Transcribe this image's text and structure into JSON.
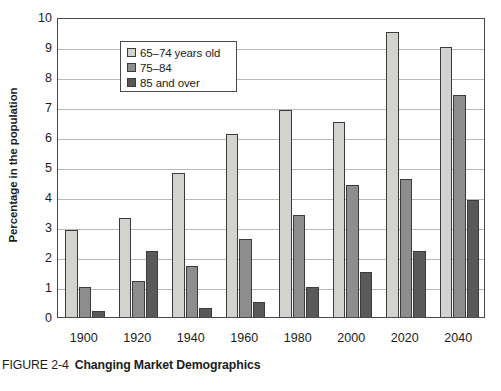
{
  "figure": {
    "caption_label": "FIGURE 2-4",
    "caption_title": "Changing Market Demographics"
  },
  "chart_data": {
    "type": "bar",
    "title": "Changing Market Demographics",
    "xlabel": "",
    "ylabel": "Percentage in the population",
    "ylim": [
      0,
      10
    ],
    "ytick_labels": [
      "10",
      "9",
      "8",
      "7",
      "6",
      "5",
      "4",
      "3",
      "2",
      "1",
      "0"
    ],
    "yticks": [
      10,
      9,
      8,
      7,
      6,
      5,
      4,
      3,
      2,
      1,
      0
    ],
    "grid": true,
    "legend_position": "upper-left-inside",
    "categories": [
      "1900",
      "1920",
      "1940",
      "1960",
      "1980",
      "2000",
      "2020",
      "2040"
    ],
    "series": [
      {
        "name": "65–74 years old",
        "color": "#d2d2cf",
        "values": [
          2.9,
          3.3,
          4.8,
          6.1,
          6.9,
          6.5,
          9.5,
          9.0
        ]
      },
      {
        "name": "75–84",
        "color": "#8d8d8d",
        "values": [
          1.0,
          1.2,
          1.7,
          2.6,
          3.4,
          4.4,
          4.6,
          7.4
        ]
      },
      {
        "name": "85 and over",
        "color": "#595959",
        "values": [
          0.2,
          2.2,
          0.3,
          0.5,
          1.0,
          1.5,
          2.2,
          3.9
        ]
      }
    ]
  }
}
